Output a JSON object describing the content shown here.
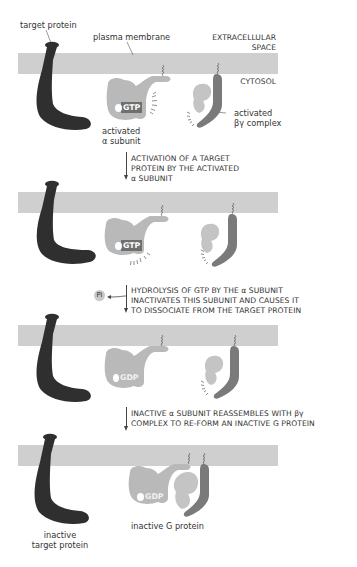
{
  "labels": {
    "target_protein": "target protein",
    "plasma_membrane": "plasma membrane",
    "extracellular_1": "EXTRACELLULAR",
    "extracellular_2": "SPACE",
    "cytosol": "CYTOSOL",
    "activated_alpha_1": "activated",
    "activated_alpha_2": "α subunit",
    "activated_by_1": "activated",
    "activated_by_2": "βγ complex",
    "inactive_g_protein": "inactive G protein",
    "inactive_target_1": "inactive",
    "inactive_target_2": "target protein"
  },
  "nucleotides": {
    "panel1": "GTP",
    "panel2": "GTP",
    "panel3": "GDP",
    "panel4": "GDP"
  },
  "phosphate": "Pi",
  "steps": [
    {
      "lines": [
        "ACTIVATION OF A TARGET",
        "PROTEIN BY THE ACTIVATED",
        " α SUBUNIT"
      ]
    },
    {
      "lines": [
        "HYDROLYSIS OF GTP BY THE α SUBUNIT",
        "INACTIVATES THIS SUBUNIT AND CAUSES IT",
        "TO DISSOCIATE FROM THE TARGET PROTEIN"
      ]
    },
    {
      "lines": [
        "INACTIVE α SUBUNIT REASSEMBLES WITH βγ",
        "COMPLEX TO RE-FORM AN INACTIVE G PROTEIN"
      ]
    }
  ],
  "colors": {
    "membrane": "#cfcfcf",
    "target_protein": "#2f2f2f",
    "alpha_subunit": "#b9b9b9",
    "beta_subunit": "#c4c4c4",
    "gamma_subunit": "#7a7a7a",
    "gtp_badge": "#6f6f6f"
  }
}
